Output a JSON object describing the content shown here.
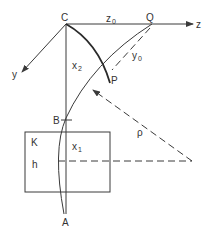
{
  "figure": {
    "type": "geometric diagram",
    "colors": {
      "stroke": "#3a3a3a",
      "background": "#ffffff"
    },
    "points": {
      "C": "C",
      "Q": "Q",
      "P": "P",
      "B": "B",
      "A": "A"
    },
    "axes": {
      "z": "z",
      "y": "y"
    },
    "labels": {
      "z0_main": "z",
      "z0_sub": "0",
      "y0_main": "y",
      "y0_sub": "0",
      "x2_main": "x",
      "x2_sub": "2",
      "x1_main": "x",
      "x1_sub": "1",
      "rho": "ρ",
      "K": "K",
      "h": "h"
    }
  }
}
